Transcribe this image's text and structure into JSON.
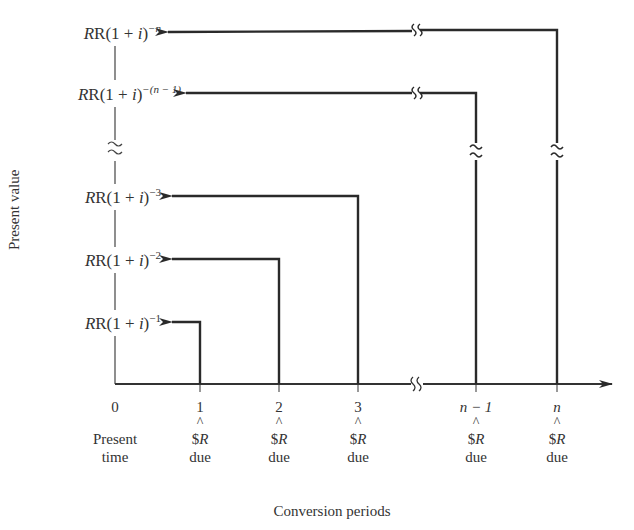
{
  "figure": {
    "y_axis_label": "Present value",
    "x_axis_label": "Conversion periods",
    "rows": [
      {
        "base": "R(1 + ",
        "var": "i",
        "close": ")",
        "exp": "−n",
        "y": 32,
        "from_x": 557
      },
      {
        "base": "R(1 + ",
        "var": "i",
        "close": ")",
        "exp": "−(n − 1)",
        "y": 93,
        "from_x": 476
      },
      {
        "base": "R(1 + ",
        "var": "i",
        "close": ")",
        "exp": "−3",
        "y": 196,
        "from_x": 358
      },
      {
        "base": "R(1 + ",
        "var": "i",
        "close": ")",
        "exp": "−2",
        "y": 259,
        "from_x": 279
      },
      {
        "base": "R(1 + ",
        "var": "i",
        "close": ")",
        "exp": "−1",
        "y": 322,
        "from_x": 200
      }
    ],
    "ticks": [
      {
        "value": "0",
        "x": 115,
        "caret": "",
        "amount": "",
        "amount_var": "",
        "note": "Present",
        "note2": "time"
      },
      {
        "value": "1",
        "x": 200,
        "caret": "^",
        "amount": "$",
        "amount_var": "R",
        "note": "due"
      },
      {
        "value": "2",
        "x": 279,
        "caret": "^",
        "amount": "$",
        "amount_var": "R",
        "note": "due"
      },
      {
        "value": "3",
        "x": 358,
        "caret": "^",
        "amount": "$",
        "amount_var": "R",
        "note": "due"
      },
      {
        "value": "n − 1",
        "x": 476,
        "caret": "^",
        "amount": "$",
        "amount_var": "R",
        "note": "due"
      },
      {
        "value": "n",
        "x": 557,
        "caret": "^",
        "amount": "$",
        "amount_var": "R",
        "note": "due"
      }
    ],
    "break_symbol": "≈"
  }
}
